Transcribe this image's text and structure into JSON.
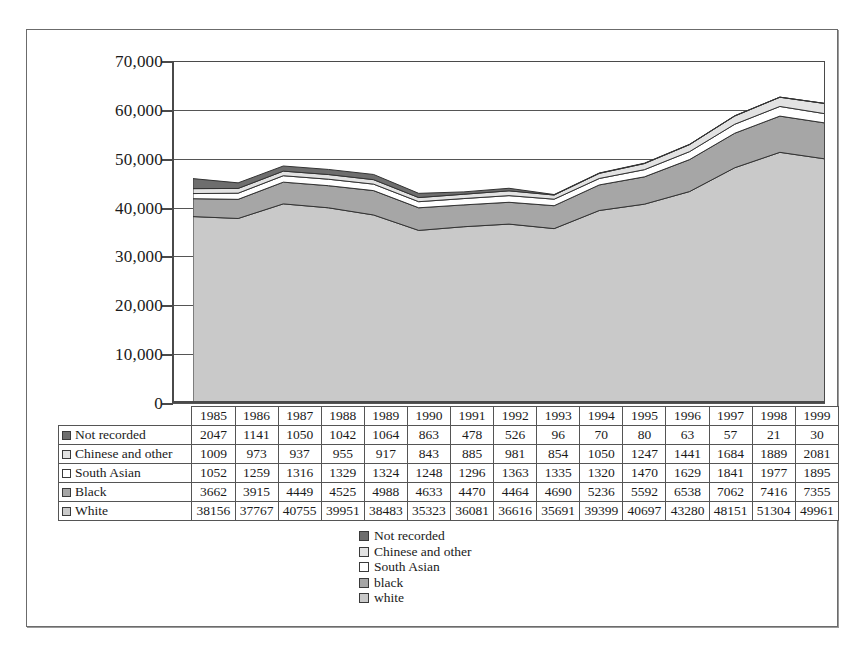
{
  "chart_data": {
    "type": "area",
    "title": "",
    "xlabel": "",
    "ylabel": "",
    "stacked": true,
    "grid": true,
    "legend_position": "bottom-center",
    "ylim": [
      0,
      70000
    ],
    "ytick_labels": [
      "70,000",
      "60,000",
      "50,000",
      "40,000",
      "30,000",
      "20,000",
      "10,000",
      "0"
    ],
    "ytick_values": [
      70000,
      60000,
      50000,
      40000,
      30000,
      20000,
      10000,
      0
    ],
    "categories": [
      "1985",
      "1986",
      "1987",
      "1988",
      "1989",
      "1990",
      "1991",
      "1992",
      "1993",
      "1994",
      "1995",
      "1996",
      "1997",
      "1998",
      "1999"
    ],
    "series": [
      {
        "name": "Not recorded",
        "stack_index": 5,
        "color": "#6e6e6e",
        "values": [
          2047,
          1141,
          1050,
          1042,
          1064,
          863,
          478,
          526,
          96,
          70,
          80,
          63,
          57,
          21,
          30
        ]
      },
      {
        "name": "Chinese and other",
        "stack_index": 4,
        "color": "#e2e2e2",
        "values": [
          1009,
          973,
          937,
          955,
          917,
          843,
          885,
          981,
          854,
          1050,
          1247,
          1441,
          1684,
          1889,
          2081
        ]
      },
      {
        "name": "South Asian",
        "stack_index": 3,
        "color": "#ffffff",
        "values": [
          1052,
          1259,
          1316,
          1329,
          1324,
          1248,
          1296,
          1363,
          1335,
          1320,
          1470,
          1629,
          1841,
          1977,
          1895
        ]
      },
      {
        "name": "Black",
        "stack_index": 2,
        "color": "#a6a6a6",
        "values": [
          3662,
          3915,
          4449,
          4525,
          4988,
          4633,
          4470,
          4464,
          4690,
          5236,
          5592,
          6538,
          7062,
          7416,
          7355
        ]
      },
      {
        "name": "White",
        "stack_index": 1,
        "color": "#c9c9c9",
        "values": [
          38156,
          37767,
          40755,
          39951,
          38483,
          35323,
          36081,
          36616,
          35691,
          39399,
          40697,
          43280,
          48151,
          51304,
          49961
        ]
      }
    ]
  },
  "table": {
    "years": [
      "1985",
      "1986",
      "1987",
      "1988",
      "1989",
      "1990",
      "1991",
      "1992",
      "1993",
      "1994",
      "1995",
      "1996",
      "1997",
      "1998",
      "1999"
    ],
    "rows": [
      {
        "label": "Not recorded",
        "swatch_color": "#6e6e6e",
        "values": [
          "2047",
          "1141",
          "1050",
          "1042",
          "1064",
          "863",
          "478",
          "526",
          "96",
          "70",
          "80",
          "63",
          "57",
          "21",
          "30"
        ]
      },
      {
        "label": "Chinese and other",
        "swatch_color": "#e2e2e2",
        "values": [
          "1009",
          "973",
          "937",
          "955",
          "917",
          "843",
          "885",
          "981",
          "854",
          "1050",
          "1247",
          "1441",
          "1684",
          "1889",
          "2081"
        ]
      },
      {
        "label": "South Asian",
        "swatch_color": "#ffffff",
        "values": [
          "1052",
          "1259",
          "1316",
          "1329",
          "1324",
          "1248",
          "1296",
          "1363",
          "1335",
          "1320",
          "1470",
          "1629",
          "1841",
          "1977",
          "1895"
        ]
      },
      {
        "label": "Black",
        "swatch_color": "#a6a6a6",
        "values": [
          "3662",
          "3915",
          "4449",
          "4525",
          "4988",
          "4633",
          "4470",
          "4464",
          "4690",
          "5236",
          "5592",
          "6538",
          "7062",
          "7416",
          "7355"
        ]
      },
      {
        "label": "White",
        "swatch_color": "#c9c9c9",
        "values": [
          "38156",
          "37767",
          "40755",
          "39951",
          "38483",
          "35323",
          "36081",
          "36616",
          "35691",
          "39399",
          "40697",
          "43280",
          "48151",
          "51304",
          "49961"
        ]
      }
    ]
  },
  "legend": {
    "items": [
      {
        "label": "Not recorded",
        "color": "#6e6e6e"
      },
      {
        "label": "Chinese and other",
        "color": "#e2e2e2"
      },
      {
        "label": "South Asian",
        "color": "#ffffff"
      },
      {
        "label": "black",
        "color": "#a6a6a6"
      },
      {
        "label": "white",
        "color": "#c9c9c9"
      }
    ]
  }
}
